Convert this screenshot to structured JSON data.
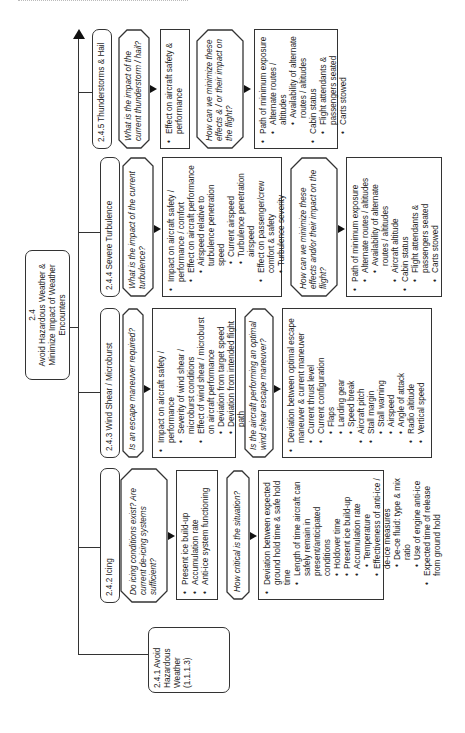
{
  "page": {
    "header_fragment": ""
  },
  "root": {
    "number": "2.4",
    "title": "Avoid Hazardous Weather & Minimize Impact of Weather Encounters"
  },
  "subgoals": [
    {
      "id": "2.4.1",
      "label": "2.4.1 Avoid Hazardous Weather (1.1.1.3)"
    },
    {
      "id": "2.4.2",
      "label": "2.4.2 Icing",
      "questions": [
        {
          "text": "Do icing conditions exist? Are current de-icing systems sufficient?",
          "details": [
            {
              "level": 1,
              "text": "Present ice build-up"
            },
            {
              "level": 1,
              "text": "Accumulation rate"
            },
            {
              "level": 1,
              "text": "Anti-ice system functioning"
            }
          ]
        },
        {
          "text": "How critical is the situation?",
          "details": [
            {
              "level": 1,
              "text": "Deviation between expected ground hold time & safe hold time"
            },
            {
              "level": 2,
              "text": "Length of time aircraft can safely remain in present/anticipated conditions"
            },
            {
              "level": 3,
              "text": "Holdover time"
            },
            {
              "level": 3,
              "text": "Present ice build-up"
            },
            {
              "level": 3,
              "text": "Accumulation rate"
            },
            {
              "level": 4,
              "text": "Temperature"
            },
            {
              "level": 3,
              "text": "Effectiveness of anti-ice / de-ice measures"
            },
            {
              "level": 4,
              "text": "De-ce fluid: type & mix ratio"
            },
            {
              "level": 4,
              "text": "Use of engine anti-ice"
            },
            {
              "level": 2,
              "text": "Expected time of release from ground hold"
            }
          ]
        }
      ]
    },
    {
      "id": "2.4.3",
      "label": "2.4.3 Wind Shear / Microburst",
      "questions": [
        {
          "text": "Is an escape maneuver required?",
          "details": [
            {
              "level": 1,
              "text": "Impact on aircraft safety / performance"
            },
            {
              "level": 2,
              "text": "Severity of wind shear / microburst conditions"
            },
            {
              "level": 2,
              "text": "Effect of wind shear / microburst on aircraft performance"
            },
            {
              "level": 3,
              "text": "Deviation from target speed"
            },
            {
              "level": 3,
              "text": "Deviation from intended flight path"
            }
          ]
        },
        {
          "text": "Is the aircraft performing an optimal wind shear escape maneuver?",
          "details": [
            {
              "level": 1,
              "text": "Deviation between optimal escape maneuver & current maneuver"
            },
            {
              "level": 2,
              "text": "Current thrust level"
            },
            {
              "level": 2,
              "text": "Current configuration"
            },
            {
              "level": 3,
              "text": "Flaps"
            },
            {
              "level": 3,
              "text": "Landing gear"
            },
            {
              "level": 3,
              "text": "Speed break"
            },
            {
              "level": 2,
              "text": "Aircraft pitch"
            },
            {
              "level": 2,
              "text": "Stall margin"
            },
            {
              "level": 3,
              "text": "Stall warning"
            },
            {
              "level": 3,
              "text": "Airspeed"
            },
            {
              "level": 3,
              "text": "Angle of attack"
            },
            {
              "level": 2,
              "text": "Radio altitude"
            },
            {
              "level": 2,
              "text": "Vertical speed"
            }
          ]
        }
      ]
    },
    {
      "id": "2.4.4",
      "label": "2.4.4 Severe Turbulence",
      "questions": [
        {
          "text": "What is the impact of the current turbulence?",
          "details": [
            {
              "level": 1,
              "text": "Impact on aircraft safety / performance / comfort"
            },
            {
              "level": 2,
              "text": "Effect on aircraft performance"
            },
            {
              "level": 3,
              "text": "Airspeed relative to turbulence penetration speed"
            },
            {
              "level": 4,
              "text": "Current airspeed"
            },
            {
              "level": 4,
              "text": "Turbulence penetration airspeed"
            },
            {
              "level": 2,
              "text": "Effect on passenger/crew comfort & safety"
            },
            {
              "level": 3,
              "text": "Turbulence severity"
            }
          ]
        },
        {
          "text": "How can we minimize these effects and/or their impact on the flight?",
          "details": [
            {
              "level": 1,
              "text": "Path of minimum exposure"
            },
            {
              "level": 2,
              "text": "Alternate routes / altitudes"
            },
            {
              "level": 3,
              "text": "Availability of alternate routes / altitudes"
            },
            {
              "level": 2,
              "text": "Aircraft altitude"
            },
            {
              "level": 1,
              "text": "Cabin status"
            },
            {
              "level": 2,
              "text": "Flight attendants & passengers seated"
            },
            {
              "level": 2,
              "text": "Carts stowed"
            }
          ]
        }
      ]
    },
    {
      "id": "2.4.5",
      "label": "2.4.5 Thunderstorms & Hail",
      "questions": [
        {
          "text": "What is the impact of the current thunderstorm / hail?",
          "details": [
            {
              "level": 1,
              "text": "Effect on aircraft safety & performance"
            }
          ]
        },
        {
          "text": "How can we minimize these effects & / or their impact on the flight?",
          "details": [
            {
              "level": 1,
              "text": "Path of minimum exposure"
            },
            {
              "level": 2,
              "text": "Alternate routes / altitudes"
            },
            {
              "level": 3,
              "text": "Availability of alternate routes / altitudes"
            },
            {
              "level": 1,
              "text": "Cabin status"
            },
            {
              "level": 2,
              "text": "Flight attendants & passengers seated"
            },
            {
              "level": 2,
              "text": "Carts stowed"
            }
          ]
        }
      ]
    }
  ]
}
